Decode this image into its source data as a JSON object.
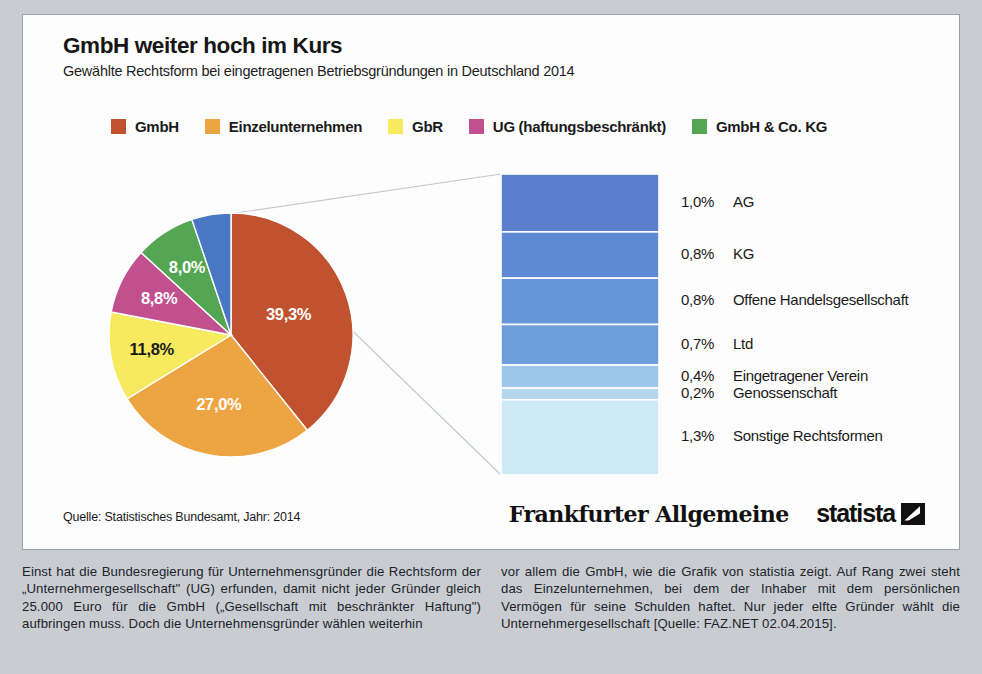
{
  "header": {
    "title": "GmbH weiter hoch im Kurs",
    "subtitle": "Gewählte Rechtsform bei eingetragenen Betriebsgründungen in Deutschland 2014"
  },
  "legend": {
    "items": [
      {
        "label": "GmbH",
        "color": "#c0522f"
      },
      {
        "label": "Einzelunternehmen",
        "color": "#eda443"
      },
      {
        "label": "GbR",
        "color": "#f7ea5e"
      },
      {
        "label": "UG (haftungsbeschränkt)",
        "color": "#c2508f"
      },
      {
        "label": "GmbH & Co. KG",
        "color": "#55a653"
      }
    ]
  },
  "chart_data": {
    "type": "pie",
    "title": "GmbH weiter hoch im Kurs",
    "subtitle": "Gewählte Rechtsform bei eingetragenen Betriebsgründungen in Deutschland 2014",
    "unit": "%",
    "categories": [
      "GmbH",
      "Einzelunternehmen",
      "GbR",
      "UG (haftungsbeschränkt)",
      "GmbH & Co. KG",
      "Sonstige (aufgeschlüsselt)"
    ],
    "values": [
      39.3,
      27.0,
      11.8,
      8.8,
      8.0,
      5.2
    ],
    "colors": [
      "#c0522f",
      "#eda443",
      "#f7ea5e",
      "#c2508f",
      "#55a653",
      "#4a77c4"
    ],
    "labels": [
      "39,3%",
      "27,0%",
      "11,8%",
      "8,8%",
      "8,0%",
      ""
    ],
    "label_colors": [
      "#ffffff",
      "#ffffff",
      "#1a1a1a",
      "#ffffff",
      "#ffffff",
      "#ffffff"
    ],
    "legend_position": "top",
    "grid": false,
    "breakout": {
      "type": "stacked_bar",
      "of_category": "Sonstige (aufgeschlüsselt)",
      "total": 5.2,
      "items": [
        {
          "pct": "1,0%",
          "value": 1.0,
          "name": "AG",
          "color": "#5b7fcc"
        },
        {
          "pct": "0,8%",
          "value": 0.8,
          "name": "KG",
          "color": "#5d8ad2"
        },
        {
          "pct": "0,8%",
          "value": 0.8,
          "name": "Offene Handelsgesellschaft",
          "color": "#6695da"
        },
        {
          "pct": "0,7%",
          "value": 0.7,
          "name": "Ltd",
          "color": "#6f9edd"
        },
        {
          "pct": "0,4%",
          "value": 0.4,
          "name": "Eingetragener Verein",
          "color": "#9dc7e8"
        },
        {
          "pct": "0,2%",
          "value": 0.2,
          "name": "Genossenschaft",
          "color": "#b5d8ef"
        },
        {
          "pct": "1,3%",
          "value": 1.3,
          "name": "Sonstige Rechtsformen",
          "color": "#cfe9f5"
        }
      ]
    }
  },
  "footer": {
    "source": "Quelle: Statistisches Bundesamt, Jahr: 2014",
    "brand_faz": "Frankfurter Allgemeine",
    "brand_statista": "statista"
  },
  "body_copy": {
    "left": "Einst hat die Bundesregierung für Unternehmensgründer die Rechtsform der „Unternehmergesellschaft\" (UG) erfunden, damit nicht jeder Gründer gleich 25.000 Euro für die GmbH („Gesellschaft mit beschränkter Haftung\") aufbringen muss. Doch die Unternehmensgründer wählen weiterhin",
    "right": "vor allem die GmbH, wie die Grafik von statistia zeigt. Auf Rang zwei steht das Einzelunternehmen, bei dem der Inhaber mit dem persönlichen Vermögen für seine Schulden haftet. Nur jeder elfte Gründer wählt die Unternehmergesellschaft [Quelle: FAZ.NET 02.04.2015]."
  }
}
